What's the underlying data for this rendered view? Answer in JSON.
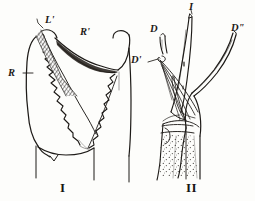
{
  "plate": {
    "background_color": "#fdfdfb",
    "ink_color": "#1d1a17",
    "width": 255,
    "height": 201,
    "medium": "line engraving",
    "subject": "comparative anatomy plate with two specimen figures"
  },
  "figures": [
    {
      "numeral": "I",
      "name": "figure-one",
      "description": "claw-like jointed appendage with serrated inner margins and crosshatched shading",
      "labels": [
        {
          "key": "R",
          "text": "R",
          "x": 8,
          "y": 72,
          "leader": true
        },
        {
          "key": "Lp",
          "text": "L'",
          "x": 45,
          "y": 20,
          "leader": true
        },
        {
          "key": "Rp",
          "text": "R'",
          "x": 80,
          "y": 31,
          "leader": false
        }
      ]
    },
    {
      "numeral": "II",
      "name": "figure-two",
      "description": "forked Y-shaped organ with three prongs, fibrous strands and stippled basal shaft",
      "labels": [
        {
          "key": "D",
          "text": "D",
          "x": 152,
          "y": 27,
          "leader": false
        },
        {
          "key": "Dp",
          "text": "D'",
          "x": 132,
          "y": 58,
          "leader": true
        },
        {
          "key": "I",
          "text": "I",
          "x": 190,
          "y": 4,
          "leader": true
        },
        {
          "key": "Dpp",
          "text": "D\"",
          "x": 230,
          "y": 26,
          "leader": false
        }
      ]
    }
  ],
  "captions": {
    "figure_one_numeral": "I",
    "figure_two_numeral": "II",
    "figure_one_numeral_x": 60,
    "figure_one_numeral_y": 181,
    "figure_two_numeral_x": 188,
    "figure_two_numeral_y": 181
  }
}
